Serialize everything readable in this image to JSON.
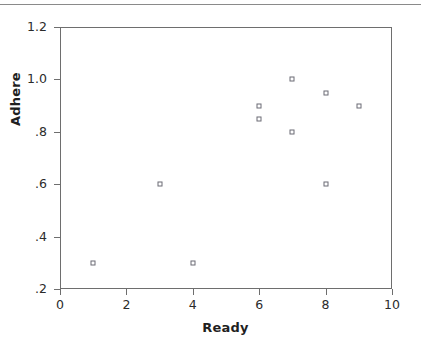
{
  "chart_data": {
    "type": "scatter",
    "title": "",
    "xlabel": "Ready",
    "ylabel": "Adhere",
    "xlim": [
      0,
      10
    ],
    "ylim": [
      0.2,
      1.2
    ],
    "xticks": [
      "0",
      "2",
      "4",
      "6",
      "8",
      "10"
    ],
    "xtick_values": [
      0,
      2,
      4,
      6,
      8,
      10
    ],
    "yticks": [
      "1.2",
      "1.0",
      ".8",
      ".6",
      ".4",
      ".2"
    ],
    "ytick_values": [
      1.2,
      1.0,
      0.8,
      0.6,
      0.4,
      0.2
    ],
    "grid": false,
    "legend": null,
    "marker": "open-square",
    "marker_color": "#6b6b74",
    "series": [
      {
        "name": "Adhere vs Ready",
        "points": [
          {
            "x": 1,
            "y": 0.3
          },
          {
            "x": 3,
            "y": 0.6
          },
          {
            "x": 4,
            "y": 0.3
          },
          {
            "x": 6,
            "y": 0.9
          },
          {
            "x": 6,
            "y": 0.85
          },
          {
            "x": 7,
            "y": 1.0
          },
          {
            "x": 7,
            "y": 0.8
          },
          {
            "x": 8,
            "y": 0.95
          },
          {
            "x": 8,
            "y": 0.6
          },
          {
            "x": 9,
            "y": 0.9
          }
        ]
      }
    ]
  },
  "colors": {
    "axis": "#6e6e6e",
    "text": "#2b2b2b",
    "marker_outline": "#6b6b74",
    "rule": "#8a8a8a",
    "background": "#ffffff"
  }
}
